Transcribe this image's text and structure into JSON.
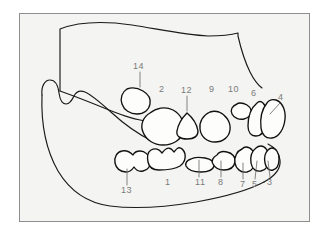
{
  "figure": {
    "kind": "line-drawing",
    "canvas": {
      "width": 329,
      "height": 236
    },
    "frame": {
      "x": 19,
      "y": 13,
      "width": 291,
      "height": 209
    },
    "colors": {
      "page_background": "#ffffff",
      "panel_background": "#f4f4f2",
      "frame_border": "#8e8e8e",
      "outline_stroke": "#1a1a1a",
      "tooth_stroke": "#111111",
      "tooth_fill": "#fdfdfc",
      "leader_stroke": "#6e6e6e",
      "label_text": "#7b7b7b"
    }
  },
  "labels": [
    {
      "id": "label-14",
      "text": "14",
      "x": 133,
      "y": 62,
      "leader": {
        "x1": 140,
        "y1": 72,
        "x2": 140,
        "y2": 87
      }
    },
    {
      "id": "label-2",
      "text": "2",
      "x": 159,
      "y": 85,
      "leader": null
    },
    {
      "id": "label-12",
      "text": "12",
      "x": 181,
      "y": 86,
      "leader": {
        "x1": 187,
        "y1": 96,
        "x2": 187,
        "y2": 111
      }
    },
    {
      "id": "label-9",
      "text": "9",
      "x": 209,
      "y": 85,
      "leader": null
    },
    {
      "id": "label-10",
      "text": "10",
      "x": 228,
      "y": 85,
      "leader": null
    },
    {
      "id": "label-6",
      "text": "6",
      "x": 251,
      "y": 89,
      "leader": null
    },
    {
      "id": "label-4",
      "text": "4",
      "x": 278,
      "y": 93,
      "leader": {
        "x1": 280,
        "y1": 103,
        "x2": 270,
        "y2": 114
      }
    },
    {
      "id": "label-13",
      "text": "13",
      "x": 121,
      "y": 186,
      "leader": {
        "x1": 127,
        "y1": 185,
        "x2": 127,
        "y2": 169
      }
    },
    {
      "id": "label-1",
      "text": "1",
      "x": 165,
      "y": 178,
      "leader": null
    },
    {
      "id": "label-11",
      "text": "11",
      "x": 195,
      "y": 178,
      "leader": {
        "x1": 199,
        "y1": 177,
        "x2": 199,
        "y2": 160
      }
    },
    {
      "id": "label-8",
      "text": "8",
      "x": 218,
      "y": 178,
      "leader": {
        "x1": 221,
        "y1": 177,
        "x2": 221,
        "y2": 161
      }
    },
    {
      "id": "label-7",
      "text": "7",
      "x": 240,
      "y": 180,
      "leader": {
        "x1": 243,
        "y1": 179,
        "x2": 243,
        "y2": 163
      }
    },
    {
      "id": "label-5",
      "text": "5",
      "x": 252,
      "y": 180,
      "leader": {
        "x1": 255,
        "y1": 179,
        "x2": 257,
        "y2": 161
      }
    },
    {
      "id": "label-3",
      "text": "3",
      "x": 267,
      "y": 178,
      "leader": {
        "x1": 270,
        "y1": 177,
        "x2": 268,
        "y2": 161
      }
    }
  ],
  "paths": {
    "upper_jaw": "M 60 91 L 60 29 C 78 22 104 21 132 25 C 158 29 185 35 208 36 C 222 36 231 35 238 33 L 238 36 C 241 49 245 62 250 72 C 254 80 258 85 262 88",
    "upper_alveolar": "M 60 91 C 74 96 92 103 109 110 C 124 116 136 120 146 121",
    "lower_jaw": "M 42 95 C 41 86 45 80 50 80 C 55 80 58 85 59 93 C 60 100 62 104 66 104 C 70 104 72 100 74 96 C 76 92 80 90 85 92 C 92 95 101 103 112 113 C 124 124 138 134 152 141",
    "lower_jaw_body": "M 42 95 C 41 122 46 150 58 171 C 70 191 88 203 110 206 C 134 209 166 207 196 202 C 224 197 249 190 264 182",
    "ramus_right": "M 264 182 C 275 176 281 168 280 160 C 279 152 274 147 268 144",
    "tooth_14": "M 127 89 C 122 92 120 98 122 104 C 124 110 130 114 137 114 C 144 114 149 110 150 104 C 151 99 148 94 143 91 C 138 88 132 87 127 89 Z",
    "tooth_2": "M 150 113 C 143 117 140 125 143 132 C 146 140 154 145 163 145 C 173 145 181 140 183 132 C 185 123 181 114 173 110 C 165 106 156 108 150 113 Z",
    "tooth_12": "M 187 113 C 182 118 178 125 177 131 C 176 136 180 139 187 139 C 194 139 198 136 198 131 C 197 125 193 118 187 113 Z",
    "tooth_9": "M 210 112 C 203 115 199 122 200 129 C 201 137 207 142 215 142 C 223 142 229 137 230 130 C 231 122 226 115 219 112 C 216 111 213 111 210 112 Z",
    "tooth_10": "M 237 104 C 232 106 230 110 232 114 C 234 118 239 120 244 119 C 249 118 252 114 251 110 C 250 106 245 103 240 103 C 239 103 238 103 237 104 Z",
    "tooth_6": "M 257 103 C 251 108 248 117 248 126 C 248 132 251 136 256 136 C 261 136 265 131 267 124 C 269 116 267 107 263 103 C 261 101 259 101 257 103 Z",
    "tooth_4": "M 267 103 C 262 109 260 119 261 128 C 262 135 266 139 272 138 C 279 137 284 129 285 119 C 286 110 282 102 276 100 C 272 99 269 100 267 103 Z",
    "tooth_13": "M 122 151 C 117 152 114 157 115 163 C 116 168 120 172 126 172 C 130 172 132 170 134 167 C 136 170 139 172 143 171 C 148 170 151 166 150 160 C 149 155 145 151 140 151 C 136 151 134 153 133 155 C 130 152 126 150 122 151 Z",
    "tooth_1": "M 151 150 C 148 152 147 157 148 162 C 149 167 153 170 159 170 C 167 170 175 169 180 166 C 184 163 186 159 185 154 C 184 150 181 147 178 148 C 176 149 175 151 174 152 C 172 149 169 147 166 149 C 164 150 163 152 162 153 C 159 149 155 148 151 150 Z",
    "tooth_11": "M 191 159 C 187 160 185 163 186 166 C 188 170 194 172 201 172 C 208 172 213 170 214 166 C 215 162 211 159 205 158 C 199 157 194 157 191 159 Z",
    "tooth_8": "M 217 155 C 213 157 211 161 213 164 C 215 168 219 170 224 170 C 230 170 234 167 235 162 C 236 157 232 153 227 152 C 223 151 219 152 217 155 Z",
    "tooth_7": "M 242 149 C 237 151 234 157 235 163 C 236 169 241 173 247 172 C 252 171 255 166 255 159 C 255 152 251 147 246 147 C 244 147 243 148 242 149 Z",
    "tooth_5": "M 256 148 C 252 151 250 157 251 163 C 252 169 256 172 261 171 C 266 170 269 165 269 158 C 269 151 265 146 261 146 C 259 146 257 147 256 148 Z",
    "tooth_3": "M 268 150 C 265 153 264 158 265 163 C 266 168 269 171 273 170 C 277 169 279 165 279 159 C 279 153 276 148 272 148 C 270 148 269 149 268 150 Z"
  }
}
